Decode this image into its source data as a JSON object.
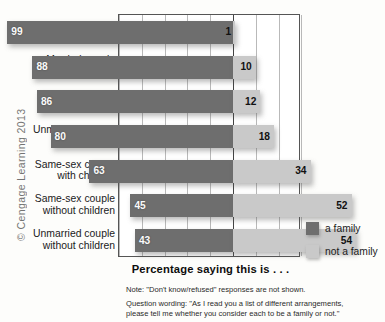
{
  "figure": {
    "copyright": "© Cengage Learning 2013",
    "axis_caption": "Percentage saying this is . . ."
  },
  "legend": {
    "items": [
      {
        "label": "a family",
        "color": "#6e6e6e",
        "swatch": "dark-swatch"
      },
      {
        "label": "not a family",
        "color": "#c9c9c9",
        "swatch": "light-swatch"
      }
    ]
  },
  "notes": [
    {
      "lines": [
        "Note: \"Don't know/refused\" responses are not shown."
      ]
    },
    {
      "lines": [
        "Question wording: \"As I read you a list of different arrangements,",
        "please tell me whether you consider each to be a family or not.\""
      ]
    }
  ],
  "chart_data": {
    "type": "bar",
    "subtype": "diverging-horizontal-bar",
    "title": "",
    "xlabel": "Percentage saying this is . . .",
    "ylabel": "",
    "categories": [
      "Married couple with children",
      "Married couple without children",
      "Single parent with children",
      "Unmarried couple with children",
      "Same-sex couple with children",
      "Same-sex couple without children",
      "Unmarried couple without children"
    ],
    "category_lines": [
      [
        "Married couple",
        "with children"
      ],
      [
        "Married couple",
        "without children"
      ],
      [
        "Single parent",
        "with children"
      ],
      [
        "Unmarried couple",
        "with children"
      ],
      [
        "Same-sex couple",
        "with children"
      ],
      [
        "Same-sex couple",
        "without children"
      ],
      [
        "Unmarried couple",
        "without children"
      ]
    ],
    "series": [
      {
        "name": "a family",
        "color": "#6e6e6e",
        "direction": "left",
        "values": [
          99,
          88,
          86,
          80,
          63,
          45,
          43
        ]
      },
      {
        "name": "not a family",
        "color": "#c9c9c9",
        "direction": "right",
        "values": [
          1,
          10,
          12,
          18,
          34,
          52,
          54
        ]
      }
    ],
    "axis_min": 0,
    "axis_max": 100,
    "grid_step": 10,
    "grid": true,
    "grid_left_steps": 5,
    "grid_right_steps": 3,
    "tick_labels": [],
    "legend_position": "right"
  }
}
